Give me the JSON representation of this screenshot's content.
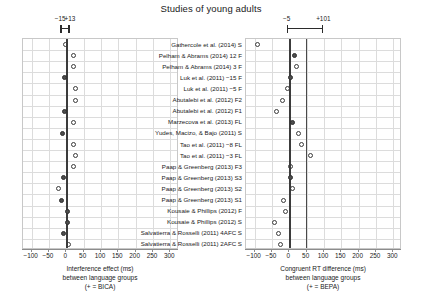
{
  "title": "Studies of young adults",
  "panels": {
    "left": {
      "name": "interference-effect-panel",
      "caption_lines": [
        "Interference effect (ms)",
        "between language groups",
        "(+ = BICA)"
      ],
      "axis_ticks": [
        -100,
        -50,
        0,
        50,
        100,
        150,
        200,
        250,
        300
      ],
      "xlim": [
        -125,
        325
      ],
      "reference_lines": [
        0
      ],
      "ci_annotation": {
        "lo_label": "−15",
        "hi_label": "+13",
        "lo": -15,
        "hi": 13
      }
    },
    "right": {
      "name": "congruent-rt-difference-panel",
      "caption_lines": [
        "Congruent RT difference (ms)",
        "between language groups",
        "(+ = BEPA)"
      ],
      "axis_ticks": [
        -100,
        -50,
        0,
        50,
        100,
        150,
        200,
        250,
        300
      ],
      "xlim": [
        -125,
        325
      ],
      "reference_lines": [
        0,
        48
      ],
      "ci_annotation": {
        "lo_label": "−5",
        "hi_label": "+101",
        "lo": -5,
        "hi": 101
      }
    }
  },
  "studies": [
    "Gathercole et al. (2014) S",
    "Pelham & Abrams (2014) 12 F",
    "Pelham & Abrams (2014) 3 F",
    "Luk et al. (2011) −15 F",
    "Luk et al. (2011) −5 F",
    "Abutalebi et al. (2012) F2",
    "Abutalebi et al. (2012) F1",
    "Marzecova et al. (2013) FL",
    "Yudes, Macizo, & Bajo (2011) S",
    "Tao et al. (2011) −8 FL",
    "Tao et al. (2011) −3 FL",
    "Paap & Greenberg (2013) F3",
    "Paap & Greenberg (2013) S3",
    "Paap & Greenberg (2013) S2",
    "Paap & Greenberg (2013) S1",
    "Kousaie & Phillips (2012) F",
    "Kousaie & Phillips (2012) S",
    "Salvatierra & Rosselli (2011) 4AFC S",
    "Salvatierra & Rosselli (2011) 2AFC S"
  ],
  "chart_data": {
    "type": "scatter",
    "title": "Studies of young adults",
    "categories": [
      "Gathercole et al. (2014) S",
      "Pelham & Abrams (2014) 12 F",
      "Pelham & Abrams (2014) 3 F",
      "Luk et al. (2011) −15 F",
      "Luk et al. (2011) −5 F",
      "Abutalebi et al. (2012) F2",
      "Abutalebi et al. (2012) F1",
      "Marzecova et al. (2013) FL",
      "Yudes, Macizo, & Bajo (2011) S",
      "Tao et al. (2011) −8 FL",
      "Tao et al. (2011) −3 FL",
      "Paap & Greenberg (2013) F3",
      "Paap & Greenberg (2013) S3",
      "Paap & Greenberg (2013) S2",
      "Paap & Greenberg (2013) S1",
      "Kousaie & Phillips (2012) F",
      "Kousaie & Phillips (2012) S",
      "Salvatierra & Rosselli (2011) 4AFC S",
      "Salvatierra & Rosselli (2011) 2AFC S"
    ],
    "series": [
      {
        "name": "Interference effect (ms)",
        "xlabel": "Interference effect (ms) between language groups (+ = BICA)",
        "xlim": [
          -125,
          325
        ],
        "reference_lines": [
          0
        ],
        "summary_interval": [
          -15,
          13
        ],
        "values": [
          -2,
          22,
          22,
          -4,
          26,
          26,
          -4,
          22,
          -10,
          22,
          26,
          22,
          -8,
          -24,
          -14,
          2,
          2,
          -8,
          6
        ],
        "filled": [
          false,
          false,
          false,
          true,
          false,
          false,
          true,
          false,
          true,
          false,
          false,
          false,
          true,
          false,
          true,
          true,
          true,
          true,
          false
        ]
      },
      {
        "name": "Congruent RT difference (ms)",
        "xlabel": "Congruent RT difference (ms) between language groups (+ = BEPA)",
        "xlim": [
          -125,
          325
        ],
        "reference_lines": [
          0,
          48
        ],
        "summary_interval": [
          -5,
          101
        ],
        "values": [
          -92,
          16,
          22,
          4,
          -4,
          -20,
          -38,
          8,
          26,
          34,
          62,
          2,
          2,
          10,
          -18,
          -10,
          -44,
          -32,
          -26
        ],
        "filled": [
          false,
          true,
          false,
          true,
          false,
          false,
          false,
          true,
          false,
          false,
          false,
          false,
          true,
          false,
          false,
          false,
          false,
          false,
          false
        ]
      }
    ]
  }
}
